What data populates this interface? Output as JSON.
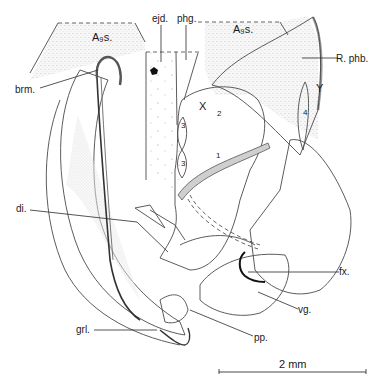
{
  "figure": {
    "type": "anatomical illustration",
    "labels": {
      "a9s_left": "A₉s.",
      "a9s_right": "A₉s.",
      "ejd": "ejd.",
      "phg": "phg.",
      "brm": "brm.",
      "r_phb": "R. phb.",
      "x": "X",
      "y": "Y",
      "num_1": "1",
      "num_2": "2",
      "num_3a": "3",
      "num_3b": "3",
      "num_4": "4",
      "di": "di.",
      "fx": "fx.",
      "vg": "vg.",
      "grl": "grl.",
      "pp": "pp."
    },
    "scale_bar": {
      "label": "2 mm"
    },
    "colors": {
      "ink": "#1a1a1a",
      "stipple_dense": "#c9c9c9",
      "stipple_light": "#ececec",
      "background": "#ffffff"
    }
  }
}
